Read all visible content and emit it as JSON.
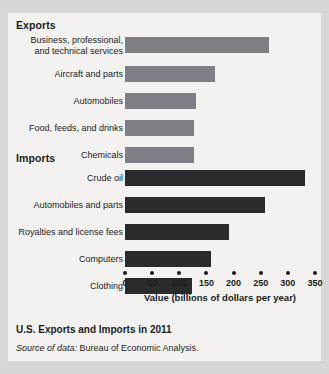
{
  "figure": {
    "caption_title": "U.S. Exports and Imports in 2011",
    "source_prefix": "Source of data:",
    "source_text": " Bureau of Economic Analysis."
  },
  "colors": {
    "exports_bar": "#7f8085",
    "imports_bar": "#2b2b2e",
    "panel_background": "#f3f2f0",
    "page_background": "#d8d8d8",
    "text": "#1b1b1b"
  },
  "chart_data": {
    "type": "bar",
    "orientation": "horizontal",
    "title": "U.S. Exports and Imports in 2011",
    "xlabel": "Value (billions of dollars per year)",
    "ylabel": "",
    "xlim": [
      0,
      350
    ],
    "xticks": [
      0,
      50,
      100,
      150,
      200,
      250,
      300,
      350
    ],
    "xtick_labels": [
      "0",
      "50",
      "100",
      "150",
      "200",
      "250",
      "300",
      "350"
    ],
    "grid": false,
    "legend": "none",
    "groups": [
      {
        "name": "Exports",
        "color": "#7f8085",
        "categories": [
          "Business, professional, and technical services",
          "Aircraft and parts",
          "Automobiles",
          "Food, feeds, and drinks",
          "Chemicals"
        ],
        "values": [
          265,
          165,
          130,
          128,
          127
        ]
      },
      {
        "name": "Imports",
        "color": "#2b2b2e",
        "categories": [
          "Crude oil",
          "Automobiles and parts",
          "Royalties and license fees",
          "Computers",
          "Clothing"
        ],
        "values": [
          331,
          258,
          192,
          158,
          123
        ]
      }
    ]
  },
  "exports": {
    "heading": "Exports",
    "rows": [
      {
        "label_line1": "Business, professional,",
        "label_line2": "and technical services",
        "value": 265
      },
      {
        "label_line1": "Aircraft and parts",
        "label_line2": "",
        "value": 165
      },
      {
        "label_line1": "Automobiles",
        "label_line2": "",
        "value": 130
      },
      {
        "label_line1": "Food, feeds, and drinks",
        "label_line2": "",
        "value": 128
      },
      {
        "label_line1": "Chemicals",
        "label_line2": "",
        "value": 127
      }
    ]
  },
  "imports": {
    "heading": "Imports",
    "rows": [
      {
        "label_line1": "Crude oil",
        "label_line2": "",
        "value": 331
      },
      {
        "label_line1": "Automobiles and parts",
        "label_line2": "",
        "value": 258
      },
      {
        "label_line1": "Royalties and license fees",
        "label_line2": "",
        "value": 192
      },
      {
        "label_line1": "Computers",
        "label_line2": "",
        "value": 158
      },
      {
        "label_line1": "Clothing",
        "label_line2": "",
        "value": 123
      }
    ]
  },
  "axis": {
    "title": "Value (billions of dollars per year)",
    "ticks": [
      "0",
      "50",
      "100",
      "150",
      "200",
      "250",
      "300",
      "350"
    ]
  }
}
